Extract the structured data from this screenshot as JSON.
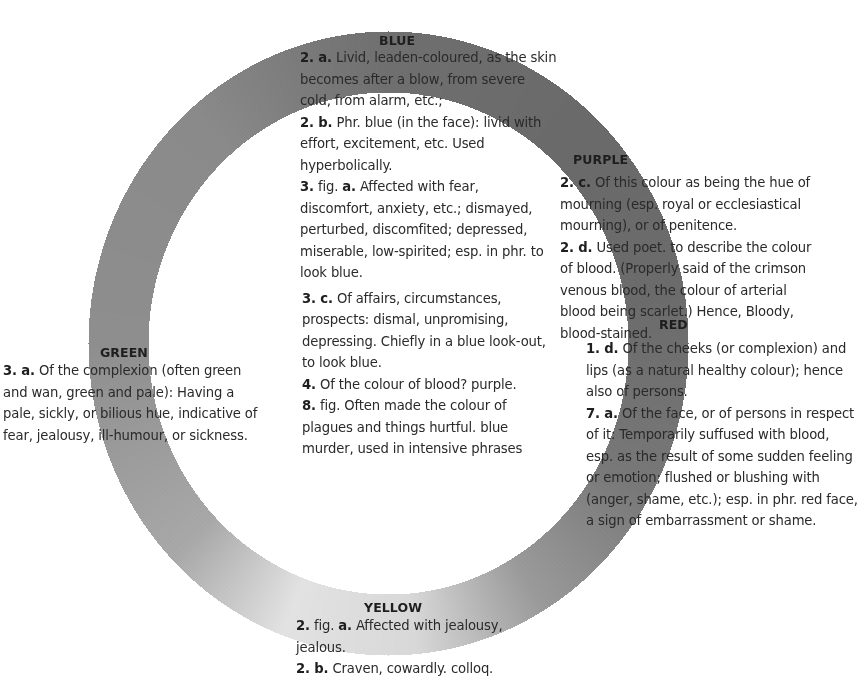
{
  "diagram": {
    "type": "colour-wheel",
    "ring": {
      "cx": 388,
      "cy": 343,
      "outer_rx": 300,
      "outer_ry": 312,
      "inner_rx": 240,
      "inner_ry": 251,
      "shading_stops": [
        {
          "angle": 0,
          "color": "#6f6f6f"
        },
        {
          "angle": 40,
          "color": "#6a6a6a"
        },
        {
          "angle": 80,
          "color": "#6b6b6b"
        },
        {
          "angle": 120,
          "color": "#787878"
        },
        {
          "angle": 150,
          "color": "#9a9a9a"
        },
        {
          "angle": 175,
          "color": "#d8d8d8"
        },
        {
          "angle": 200,
          "color": "#e2e2e2"
        },
        {
          "angle": 225,
          "color": "#a8a8a8"
        },
        {
          "angle": 270,
          "color": "#8e8e8e"
        },
        {
          "angle": 320,
          "color": "#8a8a8a"
        },
        {
          "angle": 360,
          "color": "#6f6f6f"
        }
      ]
    },
    "colours": {
      "blue": {
        "label": "BLUE",
        "entries": [
          {
            "num": "2. a.",
            "lines": [
              " Livid, leaden-coloured, as the skin",
              "becomes after a blow, from severe",
              "cold, from alarm, etc.;"
            ]
          },
          {
            "num": "2. b.",
            "lines": [
              " Phr. blue (in the face): livid with",
              "effort, excitement, etc. Used",
              "hyperbolically."
            ]
          },
          {
            "num": "3.",
            "lines": [
              " fig. ",
              "a.",
              " Affected with fear,",
              "discomfort, anxiety, etc.; dismayed,",
              "perturbed, discomfited; depressed,",
              "miserable, low-spirited; esp. in phr. to",
              "look blue."
            ]
          },
          {
            "num": "3. c.",
            "lines": [
              " Of affairs, circumstances,",
              "prospects: dismal, unpromising,",
              "depressing. Chiefly in a blue look-out,",
              "to look blue."
            ]
          },
          {
            "num": "4.",
            "lines": [
              " Of the colour of blood? purple."
            ]
          },
          {
            "num": "8.",
            "lines": [
              " fig. Often made the colour of",
              "plagues and things hurtful. blue",
              "murder, used in intensive phrases"
            ]
          }
        ]
      },
      "purple": {
        "label": "PURPLE",
        "entries": [
          {
            "num": "2. c.",
            "lines": [
              " Of this colour as being the hue of",
              "mourning (esp. royal or ecclesiastical",
              "mourning), or of penitence."
            ]
          },
          {
            "num": "2. d.",
            "lines": [
              " Used poet. to describe the colour",
              "of blood. (Properly said of the crimson",
              "venous blood, the colour of arterial",
              "blood being scarlet.) Hence, Bloody,",
              "blood-stained."
            ]
          }
        ]
      },
      "red": {
        "label": "RED",
        "entries": [
          {
            "num": "1. d.",
            "lines": [
              " Of the cheeks (or complexion) and",
              "lips (as a natural healthy colour); hence",
              "also of persons."
            ]
          },
          {
            "num": "7. a.",
            "lines": [
              " Of the face, or of persons in respect",
              "of it: Temporarily suffused with blood,",
              "esp. as the result of some sudden feeling",
              "or emotion; flushed or blushing with",
              "(anger, shame, etc.); esp. in phr. red face,",
              "a sign of embarrassment or shame."
            ]
          }
        ]
      },
      "green": {
        "label": "GREEN",
        "entries": [
          {
            "num": "3. a.",
            "lines": [
              " Of the complexion (often green",
              "and wan, green and pale): Having a",
              "pale, sickly, or bilious hue, indicative of",
              "fear, jealousy, ill-humour, or sickness."
            ]
          }
        ]
      },
      "yellow": {
        "label": "YELLOW",
        "entries": [
          {
            "num": "2.",
            "lines": [
              " fig. ",
              "a.",
              " Affected with jealousy,",
              "jealous."
            ]
          },
          {
            "num": "2. b.",
            "lines": [
              " Craven, cowardly. colloq."
            ]
          }
        ]
      }
    }
  }
}
